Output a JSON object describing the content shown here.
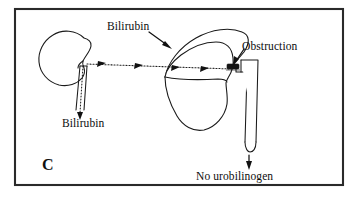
{
  "figure": {
    "panel_letter": "C",
    "background_color": "#ffffff",
    "ink_color": "#111111",
    "frame": {
      "x": 14,
      "y": 8,
      "width": 330,
      "height": 178,
      "stroke_color": "#2a2a2a"
    }
  },
  "labels": {
    "bilirubin_blood": "Bilirubin",
    "bilirubin_urine": "Bilirubin",
    "obstruction": "Obstruction",
    "no_urobilinogen": "No urobilinogen"
  },
  "structures": {
    "kidney": {
      "name": "Kidney",
      "fill": "#ffffff",
      "stroke": "#1a1a1a"
    },
    "liver": {
      "name": "Liver",
      "fill": "#ffffff",
      "stroke": "#1a1a1a"
    },
    "ureter": {
      "name": "Ureter",
      "fill": "#ffffff",
      "stroke": "#1a1a1a"
    },
    "intestine_duct": {
      "name": "Bile duct / intestine",
      "fill": "#ffffff",
      "stroke": "#1a1a1a"
    },
    "obstruction_block": {
      "name": "Obstruction block",
      "fill": "#141414"
    }
  },
  "flows": {
    "blood_flow": {
      "description": "Bilirubin carried in blood from liver toward kidney",
      "style": "dotted",
      "direction": "right-to-left",
      "arrow_count": 4
    },
    "urine_flow": {
      "description": "Bilirubin excreted down the ureter into urine",
      "style": "dotted",
      "direction": "downward",
      "arrow_count": 1
    },
    "gut_flow": {
      "description": "No urobilinogen reaches the gut below the obstruction",
      "style": "solid",
      "direction": "downward",
      "arrow_count": 1
    }
  }
}
